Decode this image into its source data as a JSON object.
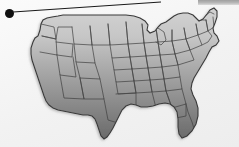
{
  "figure": {
    "kind": "thematic-choropleth-map",
    "region": "contiguous-united-states",
    "projection_note": "lower 48 states, state outlines drawn",
    "background_color": "#f2f2f2",
    "outline_color": "#333333",
    "callout": {
      "marker_shape": "filled-circle",
      "marker_color": "#101010",
      "marker_x": 9,
      "marker_y": 13,
      "marker_radius": 4,
      "leader_line_color": "#1a1a1a",
      "leader_line_from_x": 13,
      "leader_line_from_y": 12,
      "leader_line_to_x": 161,
      "leader_line_to_y": 2,
      "label_text": ""
    },
    "top_band": {
      "present": true,
      "color": "#9a9a9a",
      "x": 198,
      "y": 0,
      "width": 41,
      "height": 5
    }
  },
  "chart_data": {
    "type": "heatmap",
    "title": "",
    "xlabel": "",
    "ylabel": "",
    "legend_position": "none",
    "grid": false,
    "colorscale": {
      "name": "grayscale-linear",
      "low_color": "#d2d2d2",
      "high_color": "#6a6a6a",
      "orientation": "north-light-to-south-dark"
    },
    "categories": [
      "Washington",
      "Oregon",
      "California",
      "Idaho",
      "Nevada",
      "Utah",
      "Arizona",
      "Montana",
      "Wyoming",
      "Colorado",
      "New Mexico",
      "North Dakota",
      "South Dakota",
      "Nebraska",
      "Kansas",
      "Oklahoma",
      "Texas",
      "Minnesota",
      "Iowa",
      "Missouri",
      "Arkansas",
      "Louisiana",
      "Wisconsin",
      "Illinois",
      "Michigan",
      "Indiana",
      "Ohio",
      "Kentucky",
      "Tennessee",
      "Mississippi",
      "Alabama",
      "Georgia",
      "Florida",
      "South Carolina",
      "North Carolina",
      "Virginia",
      "West Virginia",
      "Maryland",
      "Delaware",
      "Pennsylvania",
      "New Jersey",
      "New York",
      "Connecticut",
      "Rhode Island",
      "Massachusetts",
      "Vermont",
      "New Hampshire",
      "Maine"
    ],
    "values": [
      0.18,
      0.3,
      0.52,
      0.16,
      0.4,
      0.4,
      0.6,
      0.12,
      0.28,
      0.42,
      0.62,
      0.1,
      0.22,
      0.34,
      0.48,
      0.6,
      0.78,
      0.14,
      0.3,
      0.46,
      0.6,
      0.72,
      0.2,
      0.38,
      0.22,
      0.4,
      0.38,
      0.5,
      0.56,
      0.68,
      0.68,
      0.66,
      0.82,
      0.58,
      0.52,
      0.44,
      0.42,
      0.4,
      0.4,
      0.32,
      0.36,
      0.24,
      0.26,
      0.26,
      0.22,
      0.16,
      0.14,
      0.1
    ],
    "value_range": [
      0.1,
      0.82
    ]
  }
}
